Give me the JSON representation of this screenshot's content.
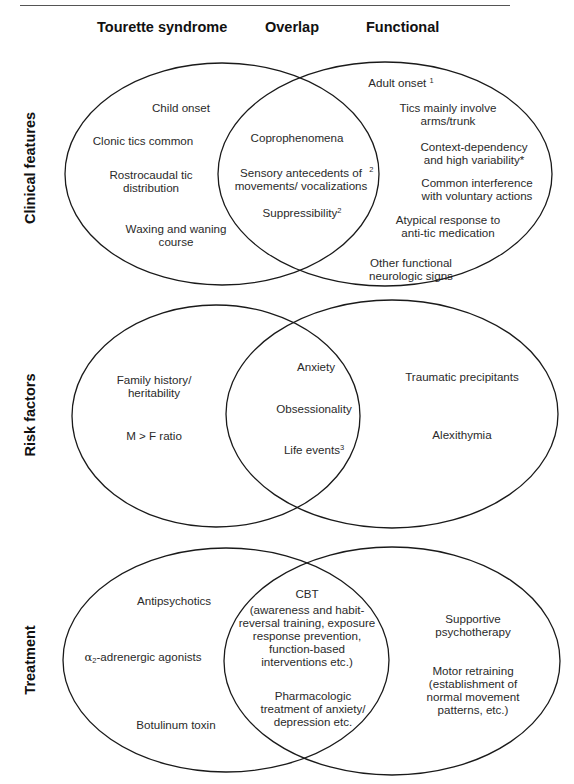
{
  "column_headers": {
    "left": "Tourette syndrome",
    "middle": "Overlap",
    "right": "Functional"
  },
  "style": {
    "stroke_color": "#1a1a1a",
    "text_color": "#2a2a2a",
    "background": "#ffffff"
  },
  "rows": [
    {
      "label": "Clinical features",
      "tourette": [
        "Child onset",
        "Clonic tics common",
        "Rostrocaudal tic\ndistribution",
        "Waxing and waning\ncourse"
      ],
      "overlap": [
        "Coprophenomena",
        "Sensory antecedents of\nmovements/ vocalizations",
        "Suppressibility"
      ],
      "overlap_sup": [
        "",
        "2",
        "2"
      ],
      "functional": [
        "Adult onset",
        "Tics mainly involve\narms/trunk",
        "Context-dependency\nand high variability*",
        "Common interference\nwith voluntary actions",
        "Atypical response to\nanti-tic medication",
        "Other functional\nneurologic signs"
      ],
      "functional_sup": [
        "1",
        "",
        "",
        "",
        "",
        ""
      ]
    },
    {
      "label": "Risk factors",
      "tourette": [
        "Family history/\nheritability",
        "M > F ratio"
      ],
      "overlap": [
        "Anxiety",
        "Obsessionality",
        "Life events"
      ],
      "overlap_sup": [
        "",
        "",
        "3"
      ],
      "functional": [
        "Traumatic precipitants",
        "Alexithymia"
      ]
    },
    {
      "label": "Treatment",
      "tourette": [
        "Antipsychotics",
        "-adrenergic agonists",
        "Botulinum toxin"
      ],
      "tourette_prefix": {
        "alpha": "α",
        "sub": "2"
      },
      "overlap": [
        "CBT",
        "(awareness and habit-\nreversal training, exposure\nresponse prevention,\nfunction-based\ninterventions etc.)",
        "Pharmacologic\ntreatment of anxiety/\ndepression etc."
      ],
      "functional": [
        "Supportive\npsychotherapy",
        "Motor retraining\n(establishment of\nnormal movement\npatterns, etc.)"
      ]
    }
  ]
}
